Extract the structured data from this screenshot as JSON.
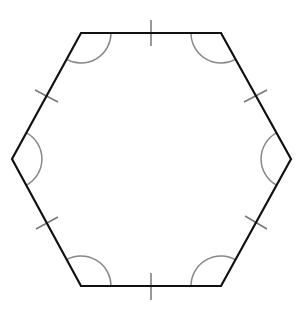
{
  "diagram": {
    "type": "regular-hexagon",
    "colors": {
      "background": "#ffffff",
      "edge": "#111111",
      "tick": "#777777",
      "arc": "#888888"
    },
    "vertices": [
      {
        "name": "top-left",
        "x": 81,
        "y": 33
      },
      {
        "name": "top-right",
        "x": 221,
        "y": 33
      },
      {
        "name": "right",
        "x": 291,
        "y": 159
      },
      {
        "name": "bottom-right",
        "x": 221,
        "y": 286
      },
      {
        "name": "bottom-left",
        "x": 81,
        "y": 286
      },
      {
        "name": "left",
        "x": 12,
        "y": 159
      }
    ],
    "side_marks": 6,
    "angle_marks": 6
  }
}
